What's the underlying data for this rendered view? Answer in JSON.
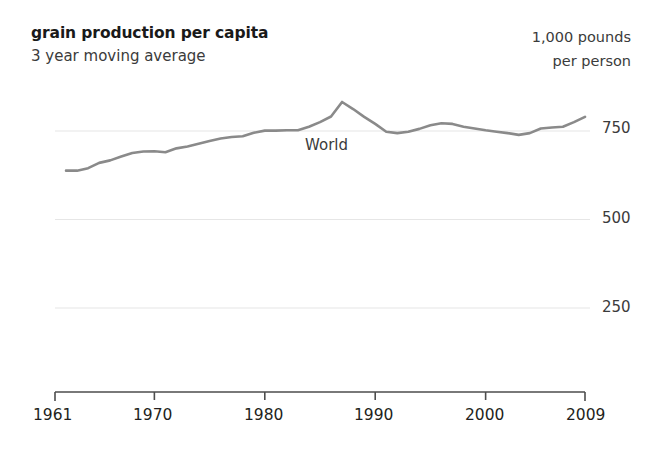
{
  "header": {
    "title": "grain production per capita",
    "subtitle": "3 year moving average",
    "unit_line_1": "1,000 pounds",
    "unit_line_2": "per person"
  },
  "chart_data": {
    "type": "line",
    "title": "grain production per capita",
    "subtitle": "3 year moving average",
    "xlabel": "",
    "ylabel": "1,000 pounds per person",
    "xlim": [
      1961,
      2009
    ],
    "ylim": [
      0,
      875
    ],
    "grid": true,
    "grid_lines": [
      750,
      500,
      250
    ],
    "legend_position": "inline-annotation",
    "yticks": [
      "750",
      "500",
      "250"
    ],
    "ytick_values": [
      750,
      500,
      250
    ],
    "xticks": [
      "1961",
      "1970",
      "1980",
      "1990",
      "2000",
      "2009"
    ],
    "xtick_values": [
      1961,
      1970,
      1980,
      1990,
      2000,
      2009
    ],
    "series": [
      {
        "name": "World",
        "color": "#8a8a8a",
        "x": [
          1962,
          1963,
          1964,
          1965,
          1966,
          1967,
          1968,
          1969,
          1970,
          1971,
          1972,
          1973,
          1974,
          1975,
          1976,
          1977,
          1978,
          1979,
          1980,
          1981,
          1982,
          1983,
          1984,
          1985,
          1986,
          1987,
          1988,
          1989,
          1990,
          1991,
          1992,
          1993,
          1994,
          1995,
          1996,
          1997,
          1998,
          1999,
          2000,
          2001,
          2002,
          2003,
          2004,
          2005,
          2006,
          2007,
          2008,
          2009
        ],
        "values": [
          638,
          638,
          645,
          660,
          667,
          678,
          688,
          692,
          693,
          690,
          701,
          706,
          714,
          722,
          729,
          733,
          735,
          745,
          751,
          751,
          752,
          752,
          762,
          775,
          791,
          832,
          812,
          790,
          770,
          748,
          744,
          748,
          756,
          766,
          772,
          770,
          762,
          757,
          752,
          748,
          744,
          739,
          744,
          757,
          760,
          762,
          775,
          790
        ]
      }
    ],
    "annotations": [
      {
        "text": "World",
        "x": 1984,
        "y": 700
      }
    ]
  },
  "axis": {
    "y_labels": [
      "750",
      "500",
      "250"
    ],
    "x_labels": [
      "1961",
      "1970",
      "1980",
      "1990",
      "2000",
      "2009"
    ],
    "series_label": "World"
  },
  "colors": {
    "line": "#8a8a8a",
    "grid": "#e6e6e6",
    "axis": "#4d4d4d",
    "text": "#231f20"
  }
}
